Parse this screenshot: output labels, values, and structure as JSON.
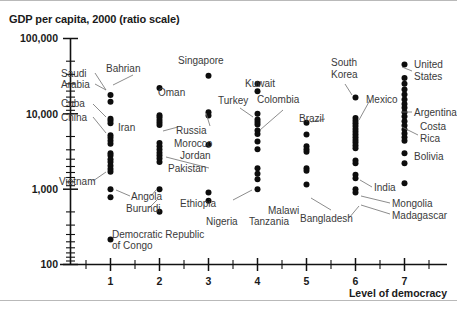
{
  "figure": {
    "title": "GDP per capita, 2000 (ratio scale)"
  },
  "chart_data": {
    "type": "scatter",
    "title": "GDP per capita, 2000 (ratio scale)",
    "xlabel": "Level of democracy",
    "ylabel": "GDP per capita, 2000 (ratio scale)",
    "yscale": "log",
    "ylim": [
      100,
      100000
    ],
    "xlim": [
      0.4,
      7.6
    ],
    "grid": false,
    "legend": null,
    "ytick_labels": [
      "100,000",
      "10,000",
      "1,000",
      "100"
    ],
    "ytick_values": [
      100000,
      10000,
      1000,
      100
    ],
    "xtick_labels": [
      "1",
      "2",
      "3",
      "4",
      "5",
      "6",
      "7"
    ],
    "xtick_values": [
      1,
      2,
      3,
      4,
      5,
      6,
      7
    ],
    "x_minor_ticks": [
      0.5,
      1.5,
      2.5,
      3.5,
      4.5,
      5.5,
      6.5,
      7.5
    ],
    "series": [
      {
        "name": "Level of democracy = 1",
        "x": 1,
        "values": [
          17800,
          14500,
          8600,
          8100,
          7500,
          5200,
          4800,
          4400,
          4000,
          3000,
          2800,
          2500,
          2300,
          2050,
          1850,
          1700,
          1000,
          780,
          215
        ]
      },
      {
        "name": "Level of democracy = 2",
        "x": 2,
        "values": [
          22000,
          9600,
          9000,
          8300,
          7700,
          7100,
          4100,
          3700,
          3350,
          3050,
          2800,
          2550,
          2300,
          1000,
          500
        ]
      },
      {
        "name": "Level of democracy = 3",
        "x": 3,
        "values": [
          32000,
          10500,
          9500,
          3900,
          900,
          700
        ]
      },
      {
        "name": "Level of democracy = 4",
        "x": 4,
        "values": [
          25000,
          20000,
          10000,
          8400,
          7800,
          7200,
          6000,
          5400,
          4300,
          3400,
          1900,
          1600,
          1350,
          1000
        ]
      },
      {
        "name": "Level of democracy = 5",
        "x": 5,
        "values": [
          7600,
          5300,
          3700,
          3400,
          3150,
          1900,
          1750,
          1150
        ]
      },
      {
        "name": "Level of democracy = 6",
        "x": 6,
        "values": [
          16500,
          8800,
          8100,
          7500,
          6900,
          6300,
          5800,
          5300,
          4900,
          4500,
          4150,
          3800,
          3500,
          2400,
          2200,
          1550,
          1400,
          1000,
          900
        ]
      },
      {
        "name": "Level of democracy = 7",
        "x": 7,
        "values": [
          45000,
          30000,
          25000,
          21000,
          18000,
          15500,
          13500,
          12000,
          10500,
          9200,
          8000,
          7000,
          6200,
          5500,
          4900,
          4400,
          3000,
          2200,
          1200
        ]
      }
    ],
    "annotations": [
      {
        "label": "Saudi Arabia",
        "x": 1,
        "y": 8100
      },
      {
        "label": "Bahrian",
        "x": 1,
        "y": 17800
      },
      {
        "label": "Cuba",
        "x": 1,
        "y": 4800
      },
      {
        "label": "China",
        "x": 1,
        "y": 3000
      },
      {
        "label": "Vietnam",
        "x": 1,
        "y": 1850
      },
      {
        "label": "Angola",
        "x": 1,
        "y": 1000
      },
      {
        "label": "Democratic Republic of Congo",
        "x": 1,
        "y": 215
      },
      {
        "label": "Oman",
        "x": 2,
        "y": 22000
      },
      {
        "label": "Iran",
        "x": 2,
        "y": 7700
      },
      {
        "label": "Pakistan",
        "x": 2,
        "y": 2300
      },
      {
        "label": "Burundi",
        "x": 2,
        "y": 500
      },
      {
        "label": "Singapore",
        "x": 3,
        "y": 32000
      },
      {
        "label": "Russia",
        "x": 3,
        "y": 9500
      },
      {
        "label": "Morocco",
        "x": 3,
        "y": 3900
      },
      {
        "label": "Jordan",
        "x": 3,
        "y": 3900
      },
      {
        "label": "Ethiopia",
        "x": 3,
        "y": 700
      },
      {
        "label": "Turkey",
        "x": 4,
        "y": 10000
      },
      {
        "label": "Kuwait",
        "x": 4,
        "y": 25000
      },
      {
        "label": "Colombia",
        "x": 4,
        "y": 7200
      },
      {
        "label": "Nigeria",
        "x": 4,
        "y": 1000
      },
      {
        "label": "Brazil",
        "x": 5,
        "y": 7600
      },
      {
        "label": "Malawi",
        "x": 5,
        "y": 1900
      },
      {
        "label": "Tanzania",
        "x": 5,
        "y": 1150
      },
      {
        "label": "South Korea",
        "x": 6,
        "y": 16500
      },
      {
        "label": "Mexico",
        "x": 6,
        "y": 16500
      },
      {
        "label": "India",
        "x": 6,
        "y": 2400
      },
      {
        "label": "Bangladesh",
        "x": 6,
        "y": 1400
      },
      {
        "label": "Mongolia",
        "x": 6,
        "y": 1550
      },
      {
        "label": "Madagascar",
        "x": 6,
        "y": 1400
      },
      {
        "label": "United States",
        "x": 7,
        "y": 30000
      },
      {
        "label": "Argentina",
        "x": 7,
        "y": 10500
      },
      {
        "label": "Costa Rica",
        "x": 7,
        "y": 7000
      },
      {
        "label": "Bolivia",
        "x": 7,
        "y": 2200
      }
    ]
  },
  "labels": {
    "saudi_arabia_1": "Saudi",
    "saudi_arabia_2": "Arabia",
    "bahrian": "Bahrian",
    "cuba": "Cuba",
    "china": "China",
    "vietnam": "Vietnam",
    "angola": "Angola",
    "drc_1": "Democratic Republic",
    "drc_2": "of Congo",
    "oman": "Oman",
    "iran": "Iran",
    "pakistan": "Pakistan",
    "burundi": "Burundi",
    "singapore": "Singapore",
    "russia": "Russia",
    "morocco": "Morocco",
    "jordan": "Jordan",
    "ethiopia": "Ethiopia",
    "turkey": "Turkey",
    "kuwait": "Kuwait",
    "colombia": "Colombia",
    "nigeria": "Nigeria",
    "brazil": "Brazil",
    "malawi": "Malawi",
    "tanzania": "Tanzania",
    "south_korea_1": "South",
    "south_korea_2": "Korea",
    "mexico": "Mexico",
    "india": "India",
    "bangladesh": "Bangladesh",
    "mongolia": "Mongolia",
    "madagascar": "Madagascar",
    "united_states_1": "United",
    "united_states_2": "States",
    "argentina": "Argentina",
    "costa_rica_1": "Costa",
    "costa_rica_2": "Rica",
    "bolivia": "Bolivia"
  },
  "axes": {
    "x_title": "Level of democracy",
    "y_100000": "100,000",
    "y_10000": "10,000",
    "y_1000": "1,000",
    "y_100": "100",
    "x1": "1",
    "x2": "2",
    "x3": "3",
    "x4": "4",
    "x5": "5",
    "x6": "6",
    "x7": "7"
  },
  "colors": {
    "dot": "#0d0d0d",
    "axis": "#111111",
    "label": "#3a3a3a",
    "leader": "#6f6f6f",
    "rule": "#b9b9b9"
  }
}
